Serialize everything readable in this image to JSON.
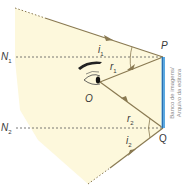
{
  "figure": {
    "type": "ray-diagram",
    "colors": {
      "background_region": "#fdf8dc",
      "ray": "#8a7a52",
      "mirror": "#5aa8e0",
      "normal_line": "#555555",
      "text": "#3a3a3a"
    },
    "points": {
      "P": "P",
      "Q": "Q",
      "O": "O"
    },
    "normals": {
      "n1": "N",
      "n1_sub": "1",
      "n2": "N",
      "n2_sub": "2"
    },
    "angles": {
      "i1": "i",
      "i1_sub": "1",
      "r1": "r",
      "r1_sub": "1",
      "i2": "i",
      "i2_sub": "2",
      "r2": "r",
      "r2_sub": "2"
    },
    "credit": {
      "line1": "Banco de imagens/",
      "line2": "Arquivo da editora"
    }
  }
}
